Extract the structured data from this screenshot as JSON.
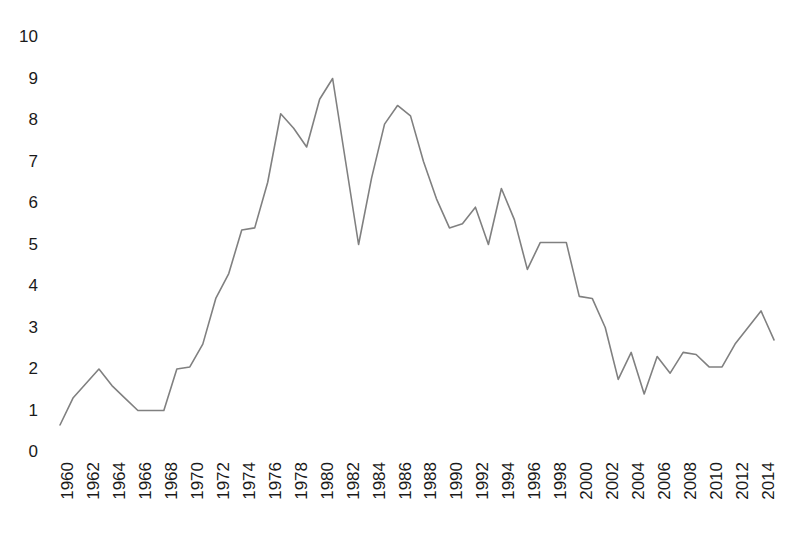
{
  "chart_data": {
    "type": "line",
    "title": "",
    "subtitle": "",
    "xlabel": "",
    "ylabel": "",
    "grid": false,
    "legend": "none",
    "line_color": "#808080",
    "text_color": "#1a1a1a",
    "background": "#ffffff",
    "ylim": [
      0,
      10
    ],
    "y_ticks": [
      0,
      1,
      2,
      3,
      4,
      5,
      6,
      7,
      8,
      9,
      10
    ],
    "y_tick_labels": [
      "0",
      "1",
      "2",
      "3",
      "4",
      "5",
      "6",
      "7",
      "8",
      "9",
      "10"
    ],
    "xlim": [
      1960,
      2015
    ],
    "x_tick_labels": [
      "1960",
      "1962",
      "1964",
      "1966",
      "1968",
      "1970",
      "1972",
      "1974",
      "1976",
      "1978",
      "1980",
      "1982",
      "1984",
      "1986",
      "1988",
      "1990",
      "1992",
      "1994",
      "1996",
      "1998",
      "2000",
      "2002",
      "2004",
      "2006",
      "2008",
      "2010",
      "2012",
      "2014"
    ],
    "x_tick_values": [
      1960,
      1962,
      1964,
      1966,
      1968,
      1970,
      1972,
      1974,
      1976,
      1978,
      1980,
      1982,
      1984,
      1986,
      1988,
      1990,
      1992,
      1994,
      1996,
      1998,
      2000,
      2002,
      2004,
      2006,
      2008,
      2010,
      2012,
      2014
    ],
    "x": [
      1960,
      1961,
      1962,
      1963,
      1964,
      1965,
      1966,
      1967,
      1968,
      1969,
      1970,
      1971,
      1972,
      1973,
      1974,
      1975,
      1976,
      1977,
      1978,
      1979,
      1980,
      1981,
      1982,
      1983,
      1984,
      1985,
      1986,
      1987,
      1988,
      1989,
      1990,
      1991,
      1992,
      1993,
      1994,
      1995,
      1996,
      1997,
      1998,
      1999,
      2000,
      2001,
      2002,
      2003,
      2004,
      2005,
      2006,
      2007,
      2008,
      2009,
      2010,
      2011,
      2012,
      2013,
      2014,
      2015
    ],
    "values": [
      0.65,
      1.3,
      1.65,
      2.0,
      1.6,
      1.3,
      1.0,
      1.0,
      1.0,
      2.0,
      2.05,
      2.6,
      3.7,
      4.3,
      5.35,
      5.4,
      6.5,
      8.15,
      7.8,
      7.35,
      8.5,
      9.0,
      7.0,
      5.0,
      6.6,
      7.9,
      8.35,
      8.1,
      7.0,
      6.1,
      5.4,
      5.5,
      5.9,
      5.0,
      6.35,
      5.6,
      4.4,
      5.05,
      5.05,
      5.05,
      3.75,
      3.7,
      3.0,
      1.75,
      2.4,
      1.4,
      2.3,
      1.9,
      2.4,
      2.35,
      2.05,
      2.05,
      2.6,
      3.0,
      3.4,
      2.7
    ],
    "series": [
      {
        "name": "series-1",
        "values": [
          0.65,
          1.3,
          1.65,
          2.0,
          1.6,
          1.3,
          1.0,
          1.0,
          1.0,
          2.0,
          2.05,
          2.6,
          3.7,
          4.3,
          5.35,
          5.4,
          6.5,
          8.15,
          7.8,
          7.35,
          8.5,
          9.0,
          7.0,
          5.0,
          6.6,
          7.9,
          8.35,
          8.1,
          7.0,
          6.1,
          5.4,
          5.5,
          5.9,
          5.0,
          6.35,
          5.6,
          4.4,
          5.05,
          5.05,
          5.05,
          3.75,
          3.7,
          3.0,
          1.75,
          2.4,
          1.4,
          2.3,
          1.9,
          2.4,
          2.35,
          2.05,
          2.05,
          2.6,
          3.0,
          3.4,
          2.7
        ]
      }
    ]
  }
}
